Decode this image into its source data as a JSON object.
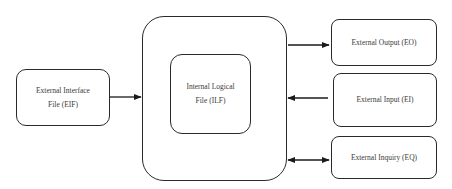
{
  "diagram": {
    "type": "function-point-components",
    "nodes": {
      "eif": {
        "line1": "External Interface",
        "line2": "File (EIF)"
      },
      "ilf": {
        "line1": "Internal Logical",
        "line2": "File (ILF)"
      },
      "eo": {
        "label": "External Output (EO)"
      },
      "ei": {
        "label": "External Input (EI)"
      },
      "eq": {
        "label": "External Inquiry (EQ)"
      }
    },
    "edges": [
      {
        "from": "External Interface File (EIF)",
        "to": "Application boundary",
        "direction": "right"
      },
      {
        "from": "Application boundary",
        "to": "External Output (EO)",
        "direction": "right"
      },
      {
        "from": "External Input (EI)",
        "to": "Application boundary",
        "direction": "left"
      },
      {
        "from": "Application boundary",
        "to": "External Inquiry (EQ)",
        "direction": "bidirectional"
      }
    ],
    "colors": {
      "stroke": "#2a2a2a",
      "text": "#3a3a3a",
      "background": "#ffffff"
    }
  }
}
